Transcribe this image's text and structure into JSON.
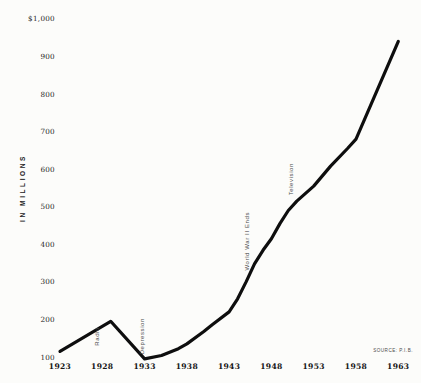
{
  "chart_data": {
    "type": "line",
    "title": "",
    "ylabel": "IN MILLIONS",
    "xlabel": "",
    "grid": false,
    "legend": "none",
    "line_color": "#0e0e0e",
    "ylim": [
      100,
      1000
    ],
    "xlim": [
      1923,
      1963
    ],
    "y_ticks": [
      {
        "label": "$1,000",
        "value": 1000
      },
      {
        "label": "900",
        "value": 900
      },
      {
        "label": "800",
        "value": 800
      },
      {
        "label": "700",
        "value": 700
      },
      {
        "label": "600",
        "value": 600
      },
      {
        "label": "500",
        "value": 500
      },
      {
        "label": "400",
        "value": 400
      },
      {
        "label": "300",
        "value": 300
      },
      {
        "label": "200",
        "value": 200
      },
      {
        "label": "100",
        "value": 100
      }
    ],
    "x_ticks": [
      {
        "label": "1923",
        "value": 1923
      },
      {
        "label": "1928",
        "value": 1928
      },
      {
        "label": "1933",
        "value": 1933
      },
      {
        "label": "1938",
        "value": 1938
      },
      {
        "label": "1943",
        "value": 1943
      },
      {
        "label": "1948",
        "value": 1948
      },
      {
        "label": "1953",
        "value": 1953
      },
      {
        "label": "1958",
        "value": 1958
      },
      {
        "label": "1963",
        "value": 1963
      }
    ],
    "series": [
      {
        "name": "advertising revenue (millions of dollars)",
        "points": [
          [
            1923,
            115
          ],
          [
            1929,
            195
          ],
          [
            1933,
            95
          ],
          [
            1935,
            104
          ],
          [
            1937,
            122
          ],
          [
            1938,
            135
          ],
          [
            1940,
            168
          ],
          [
            1941,
            186
          ],
          [
            1943,
            220
          ],
          [
            1944,
            255
          ],
          [
            1945,
            300
          ],
          [
            1946,
            348
          ],
          [
            1947,
            384
          ],
          [
            1948,
            415
          ],
          [
            1949,
            455
          ],
          [
            1950,
            490
          ],
          [
            1951,
            515
          ],
          [
            1953,
            555
          ],
          [
            1955,
            608
          ],
          [
            1957,
            655
          ],
          [
            1958,
            680
          ],
          [
            1963,
            940
          ]
        ]
      }
    ],
    "annotations": [
      {
        "label": "Radio",
        "year": 1927.4,
        "value": 130
      },
      {
        "label": "Depression",
        "year": 1932.7,
        "value": 107
      },
      {
        "label": "World War II Ends",
        "year": 1945.1,
        "value": 330
      },
      {
        "label": "Television",
        "year": 1950.3,
        "value": 530
      }
    ],
    "source": "SOURCE: P.I.B."
  }
}
